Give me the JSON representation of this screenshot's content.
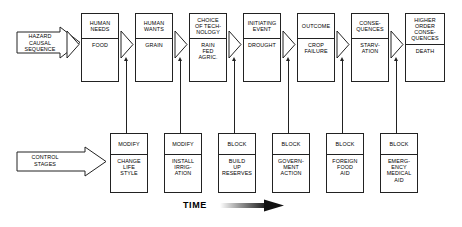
{
  "diagram": {
    "time_axis": {
      "label": "TIME",
      "arrow_icon": "right-gradient-arrow-icon"
    },
    "rows": [
      {
        "id": "hazard-causal-sequence",
        "label": "HAZARD\nCAUSAL\nSEQUENCE",
        "arrow_icon": "right-flag-arrow-icon",
        "stages": [
          {
            "header": "HUMAN\nNEEDS",
            "value": "FOOD"
          },
          {
            "header": "HUMAN\nWANTS",
            "value": "GRAIN"
          },
          {
            "header": "CHOICE\nOF TECH-\nNOLOGY",
            "value": "RAIN\nFED\nAGRIC."
          },
          {
            "header": "INITIATING\nEVENT",
            "value": "DROUGHT"
          },
          {
            "header": "OUTCOME",
            "value": "CROP\nFAILURE"
          },
          {
            "header": "CONSE-\nQUENCES",
            "value": "STARV-\nATION"
          },
          {
            "header": "HIGHER\nORDER\nCONSE-\nQUENCES",
            "value": "DEATH"
          }
        ]
      },
      {
        "id": "control-stages",
        "label": "CONTROL\nSTAGES",
        "arrow_icon": "right-flag-arrow-icon",
        "stages": [
          {
            "header": "MODIFY",
            "value": "CHANGE\nLIFE\nSTYLE"
          },
          {
            "header": "MODIFY",
            "value": "INSTALL\nIRRIG-\nATION"
          },
          {
            "header": "BLOCK",
            "value": "BUILD\nUP\nRESERVES"
          },
          {
            "header": "BLOCK",
            "value": "GOVERN-\nMENT\nACTION"
          },
          {
            "header": "BLOCK",
            "value": "FOREIGN\nFOOD\nAID"
          },
          {
            "header": "BLOCK",
            "value": "EMERG-\nENCY\nMEDICAL\nAID"
          }
        ]
      }
    ],
    "connectors": {
      "between_stages_icon": "chevron-right-icon",
      "control_to_sequence_icon": "up-arrow-icon",
      "count_chevrons": 7,
      "count_control_links": 6
    },
    "colors": {
      "line": "#222222",
      "background": "#ffffff",
      "text": "#000000"
    }
  }
}
